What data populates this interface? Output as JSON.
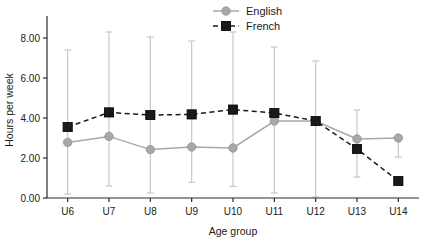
{
  "chart_data": {
    "type": "line",
    "title": "",
    "xlabel": "Age group",
    "ylabel": "Hours per week",
    "categories": [
      "U6",
      "U7",
      "U8",
      "U9",
      "U10",
      "U11",
      "U12",
      "U13",
      "U14"
    ],
    "ylim": [
      0.0,
      8.8
    ],
    "yticks": [
      0.0,
      2.0,
      4.0,
      6.0,
      8.0
    ],
    "ytick_labels": [
      "0.00",
      "2.00",
      "4.00",
      "6.00",
      "8.00"
    ],
    "grid": false,
    "legend_position": "top-center",
    "error_bars": "combined vertical range bars drawn in light grey at each age group",
    "series": [
      {
        "name": "English",
        "marker": "circle",
        "line_style": "solid",
        "color": "#a8a8a8",
        "values": [
          2.78,
          3.08,
          2.42,
          2.55,
          2.5,
          3.85,
          3.85,
          2.95,
          3.0
        ],
        "err_low": [
          0.2,
          0.6,
          0.25,
          0.78,
          0.58,
          0.25,
          0.05,
          1.05,
          2.05
        ],
        "err_high": [
          7.4,
          8.3,
          8.05,
          7.85,
          8.3,
          7.55,
          6.85,
          4.4,
          3.0
        ]
      },
      {
        "name": "French",
        "marker": "square",
        "line_style": "dashed",
        "color": "#1a1a1a",
        "values": [
          3.55,
          4.28,
          4.15,
          4.18,
          4.42,
          4.25,
          3.85,
          2.45,
          0.85
        ],
        "err_low": [
          null,
          null,
          null,
          null,
          null,
          null,
          null,
          null,
          null
        ],
        "err_high": [
          null,
          null,
          null,
          null,
          null,
          null,
          null,
          null,
          null
        ]
      }
    ]
  },
  "legend": {
    "items": [
      {
        "label": "English"
      },
      {
        "label": "French"
      }
    ]
  },
  "axes": {
    "x_title": "Age group",
    "y_title": "Hours per week"
  }
}
